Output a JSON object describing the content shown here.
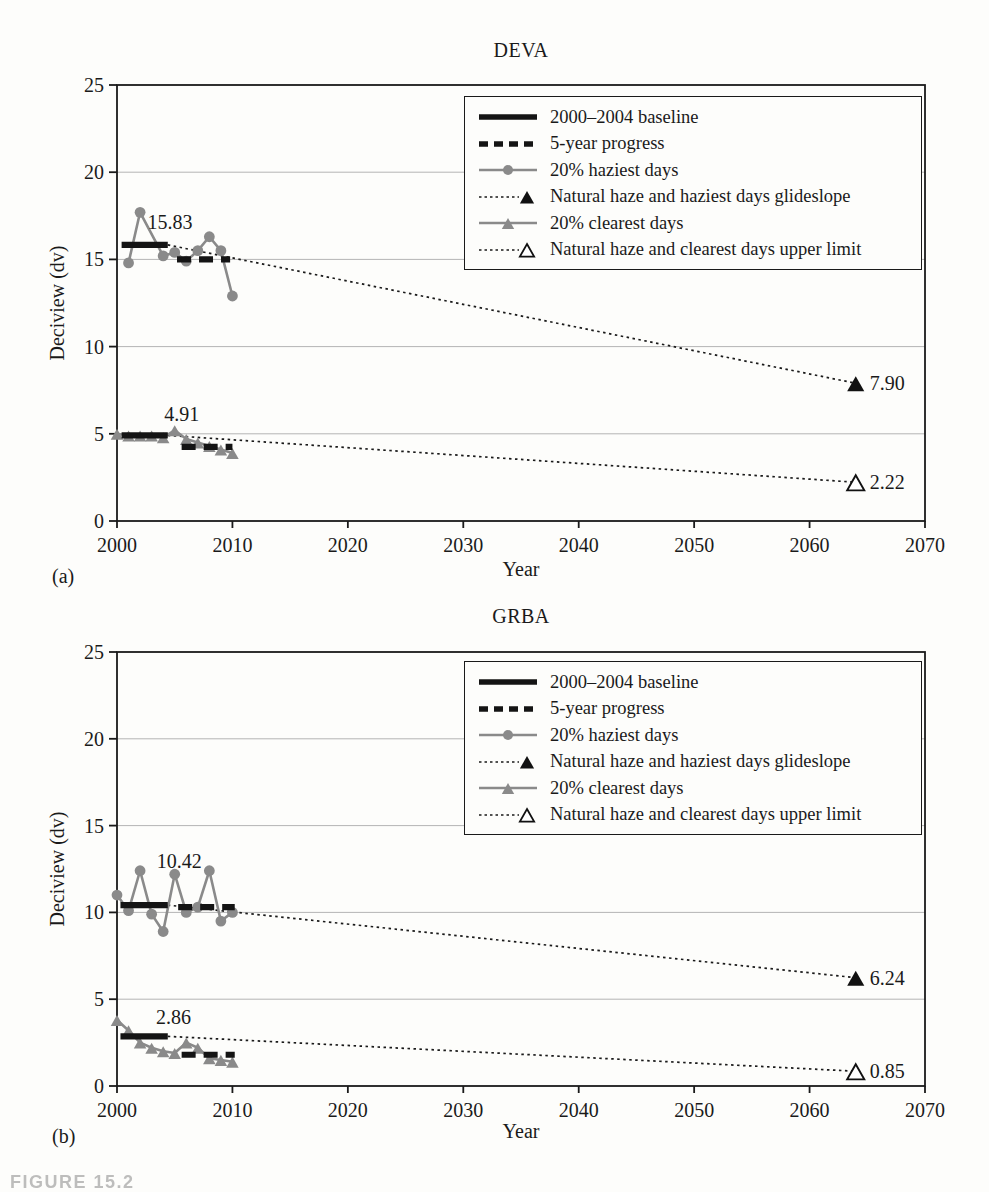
{
  "figure": {
    "caption": "FIGURE 15.2"
  },
  "chart_data": [
    {
      "type": "line",
      "panel_label": "(a)",
      "title": "DEVA",
      "xlabel": "Year",
      "ylabel": "Deciview (dv)",
      "xlim": [
        2000,
        2070
      ],
      "ylim": [
        0,
        25
      ],
      "xticks": [
        2000,
        2010,
        2020,
        2030,
        2040,
        2050,
        2060,
        2070
      ],
      "yticks": [
        0,
        5,
        10,
        15,
        20,
        25
      ],
      "grid": "horizontal-light",
      "legend_position": "top-right",
      "colors": {
        "series_gray": "#8a8a8a",
        "line_black": "#1a1a1a",
        "grid": "#b4b4b4"
      },
      "legend": [
        {
          "label": "2000–2004 baseline",
          "style": "baseline"
        },
        {
          "label": "5-year progress",
          "style": "progress"
        },
        {
          "label": "20% haziest days",
          "style": "haziest"
        },
        {
          "label": "Natural haze and haziest days glideslope",
          "style": "glideslope"
        },
        {
          "label": "20% clearest days",
          "style": "clearest"
        },
        {
          "label": "Natural haze and clearest days upper limit",
          "style": "upperlimit"
        }
      ],
      "series": [
        {
          "name": "2000–2004 baseline (haziest days)",
          "style": "baseline",
          "x": [
            2000.4,
            2004.4
          ],
          "y": [
            15.83,
            15.83
          ],
          "value": 15.83
        },
        {
          "name": "5-year progress (haziest days)",
          "style": "progress",
          "x": [
            2005.2,
            2009.8
          ],
          "y": [
            15.0,
            15.0
          ]
        },
        {
          "name": "20% haziest days",
          "style": "haziest",
          "x": [
            2001,
            2002,
            2004,
            2005,
            2006,
            2007,
            2008,
            2009,
            2010
          ],
          "y": [
            14.8,
            17.7,
            15.2,
            15.4,
            14.9,
            15.5,
            16.3,
            15.5,
            12.9
          ]
        },
        {
          "name": "Natural haze and haziest days glideslope",
          "style": "glideslope",
          "x": [
            2004.4,
            2064
          ],
          "y": [
            15.83,
            7.9
          ],
          "end_label": "7.90"
        },
        {
          "name": "2000–2004 baseline (clearest days)",
          "style": "baseline",
          "x": [
            2000.4,
            2004.4
          ],
          "y": [
            4.91,
            4.91
          ],
          "value": 4.91
        },
        {
          "name": "5-year progress (clearest days)",
          "style": "progress",
          "x": [
            2005.6,
            2010
          ],
          "y": [
            4.25,
            4.25
          ]
        },
        {
          "name": "20% clearest days",
          "style": "clearest",
          "x": [
            2000,
            2001,
            2002,
            2003,
            2004,
            2005,
            2006,
            2007,
            2008,
            2009,
            2010
          ],
          "y": [
            5.0,
            4.9,
            4.9,
            4.9,
            4.8,
            5.2,
            4.7,
            4.5,
            4.3,
            4.1,
            3.9
          ]
        },
        {
          "name": "Natural haze and clearest days upper limit",
          "style": "upperlimit",
          "x": [
            2004.4,
            2064
          ],
          "y": [
            4.91,
            2.22
          ],
          "end_label": "2.22"
        }
      ],
      "annotations": [
        {
          "text": "15.83",
          "x": 2004.6,
          "y": 17.15
        },
        {
          "text": "4.91",
          "x": 2005.6,
          "y": 6.15
        }
      ]
    },
    {
      "type": "line",
      "panel_label": "(b)",
      "title": "GRBA",
      "xlabel": "Year",
      "ylabel": "Deciview (dv)",
      "xlim": [
        2000,
        2070
      ],
      "ylim": [
        0,
        25
      ],
      "xticks": [
        2000,
        2010,
        2020,
        2030,
        2040,
        2050,
        2060,
        2070
      ],
      "yticks": [
        0,
        5,
        10,
        15,
        20,
        25
      ],
      "grid": "horizontal-light",
      "legend_position": "top-right",
      "colors": {
        "series_gray": "#8a8a8a",
        "line_black": "#1a1a1a",
        "grid": "#b4b4b4"
      },
      "legend": [
        {
          "label": "2000–2004 baseline",
          "style": "baseline"
        },
        {
          "label": "5-year progress",
          "style": "progress"
        },
        {
          "label": "20% haziest days",
          "style": "haziest"
        },
        {
          "label": "Natural haze and haziest days glideslope",
          "style": "glideslope"
        },
        {
          "label": "20% clearest days",
          "style": "clearest"
        },
        {
          "label": "Natural haze and clearest days upper limit",
          "style": "upperlimit"
        }
      ],
      "series": [
        {
          "name": "2000–2004 baseline (haziest days)",
          "style": "baseline",
          "x": [
            2000.3,
            2004.4
          ],
          "y": [
            10.42,
            10.42
          ],
          "value": 10.42
        },
        {
          "name": "5-year progress (haziest days)",
          "style": "progress",
          "x": [
            2005.3,
            2010.2
          ],
          "y": [
            10.3,
            10.3
          ]
        },
        {
          "name": "20% haziest days",
          "style": "haziest",
          "x": [
            2000,
            2001,
            2002,
            2003,
            2004,
            2005,
            2006,
            2007,
            2008,
            2009,
            2010
          ],
          "y": [
            11.0,
            10.1,
            12.4,
            9.9,
            8.9,
            12.2,
            10.0,
            10.3,
            12.4,
            9.5,
            10.0
          ]
        },
        {
          "name": "Natural haze and haziest days glideslope",
          "style": "glideslope",
          "x": [
            2004.4,
            2064
          ],
          "y": [
            10.42,
            6.24
          ],
          "end_label": "6.24"
        },
        {
          "name": "2000–2004 baseline (clearest days)",
          "style": "baseline",
          "x": [
            2000.3,
            2004.4
          ],
          "y": [
            2.86,
            2.86
          ],
          "value": 2.86
        },
        {
          "name": "5-year progress (clearest days)",
          "style": "progress",
          "x": [
            2005.6,
            2010.2
          ],
          "y": [
            1.8,
            1.8
          ]
        },
        {
          "name": "20% clearest days",
          "style": "clearest",
          "x": [
            2000,
            2001,
            2002,
            2003,
            2004,
            2005,
            2006,
            2007,
            2008,
            2009,
            2010
          ],
          "y": [
            3.8,
            3.2,
            2.5,
            2.2,
            2.0,
            1.9,
            2.5,
            2.2,
            1.6,
            1.5,
            1.4
          ]
        },
        {
          "name": "Natural haze and clearest days upper limit",
          "style": "upperlimit",
          "x": [
            2004.4,
            2064
          ],
          "y": [
            2.86,
            0.85
          ],
          "end_label": "0.85"
        }
      ],
      "annotations": [
        {
          "text": "10.42",
          "x": 2005.4,
          "y": 12.95
        },
        {
          "text": "2.86",
          "x": 2004.9,
          "y": 3.95
        }
      ]
    }
  ]
}
